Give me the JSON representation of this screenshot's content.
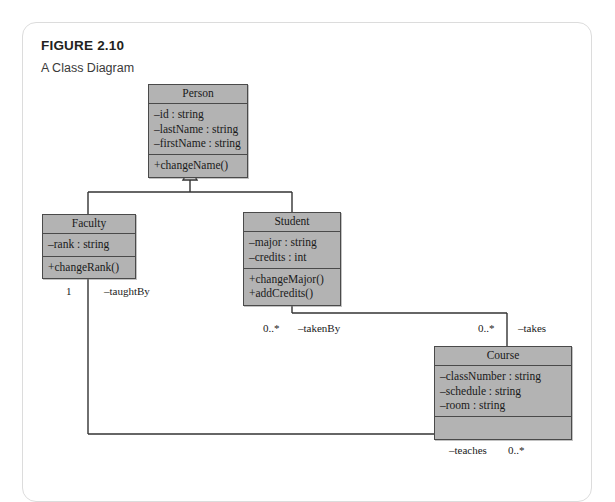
{
  "figure": {
    "number": "FIGURE 2.10",
    "caption": "A Class Diagram"
  },
  "diagram": {
    "type": "uml-class-diagram",
    "classes": [
      {
        "id": "person",
        "name": "Person",
        "attributes": [
          "–id : string",
          "–lastName : string",
          "–firstName : string"
        ],
        "operations": [
          "+changeName()"
        ]
      },
      {
        "id": "faculty",
        "name": "Faculty",
        "attributes": [
          "–rank : string"
        ],
        "operations": [
          "+changeRank()"
        ]
      },
      {
        "id": "student",
        "name": "Student",
        "attributes": [
          "–major : string",
          "–credits : int"
        ],
        "operations": [
          "+changeMajor()",
          "+addCredits()"
        ]
      },
      {
        "id": "course",
        "name": "Course",
        "attributes": [
          "–classNumber : string",
          "–schedule : string",
          "–room : string"
        ],
        "operations": []
      }
    ],
    "generalizations": [
      {
        "from": "faculty",
        "to": "person"
      },
      {
        "from": "student",
        "to": "person"
      }
    ],
    "edge_labels": {
      "faculty_multiplicity": "1",
      "faculty_role": "–taughtBy",
      "student_multiplicity": "0..*",
      "student_role": "–takenBy",
      "course_takes_multiplicity": "0..*",
      "course_takes_role": "–takes",
      "course_teaches_role": "–teaches",
      "course_teaches_multiplicity": "0..*"
    },
    "colors": {
      "class_fill": "#b3b3b3",
      "class_border": "#4a4a4a",
      "line": "#333333",
      "card_border": "#dcdcdc",
      "text": "#1a1a1a"
    }
  }
}
